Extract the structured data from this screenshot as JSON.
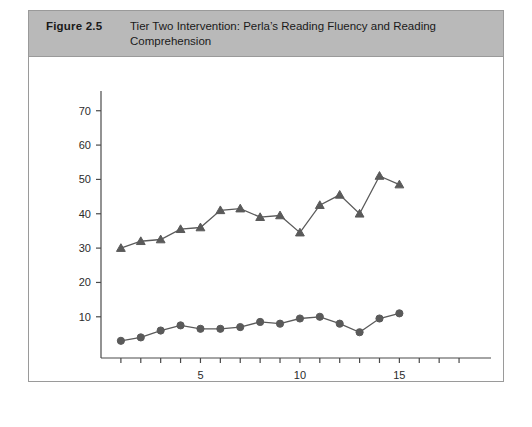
{
  "figure": {
    "number": "Figure 2.5",
    "title": "Tier Two Intervention: Perla’s Reading Fluency and Reading Comprehension",
    "header_bg": "#b9b9b9",
    "border_color": "#9a9a9a",
    "background": "#ffffff"
  },
  "chart_data": {
    "type": "line",
    "title": "Tier Two Intervention: Perla’s Reading Fluency and Reading Comprehension",
    "xlabel": "",
    "ylabel": "",
    "x": [
      1,
      2,
      3,
      4,
      5,
      6,
      7,
      8,
      9,
      10,
      11,
      12,
      13,
      14,
      15
    ],
    "series": [
      {
        "name": "Reading Comprehension",
        "marker": "circle",
        "color": "#5a5a5a",
        "values": [
          3,
          4,
          6,
          7.5,
          6.5,
          6.5,
          7,
          8.5,
          8,
          9.5,
          10,
          8,
          5.5,
          9.5,
          11
        ]
      },
      {
        "name": "Reading Fluency",
        "marker": "triangle",
        "color": "#5a5a5a",
        "values": [
          30,
          32,
          32.5,
          35.5,
          36,
          41,
          41.5,
          39,
          39.5,
          34.5,
          42.5,
          45.5,
          40,
          51,
          48.5
        ]
      }
    ],
    "ylim": [
      -2,
      74
    ],
    "xlim": [
      0,
      18.5
    ],
    "yticks": [
      10,
      20,
      30,
      40,
      50,
      60,
      70
    ],
    "ytick_labels": [
      "10",
      "20",
      "30",
      "40",
      "50",
      "60",
      "70"
    ],
    "xticks": [
      1,
      2,
      3,
      4,
      5,
      6,
      7,
      8,
      9,
      10,
      11,
      12,
      13,
      14,
      15,
      16,
      17,
      18
    ],
    "xtick_labels_shown": [
      {
        "value": 5,
        "label": "5"
      },
      {
        "value": 10,
        "label": "10"
      },
      {
        "value": 15,
        "label": "15"
      }
    ],
    "grid": false,
    "legend_position": "bottom-center"
  }
}
